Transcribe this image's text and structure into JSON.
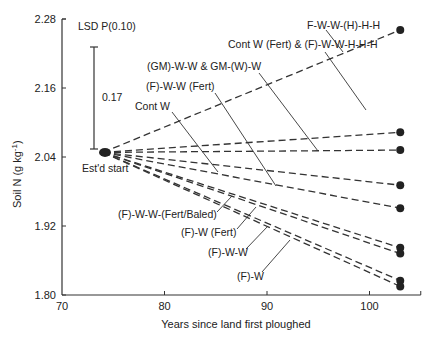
{
  "chart_data": {
    "type": "line",
    "title": "",
    "xlabel": "Years since land first ploughed",
    "ylabel": "Soil N (g kg-1)",
    "ylabel_main": "Soil N (g kg",
    "ylabel_sup": "-1",
    "ylabel_close": ")",
    "xlim": [
      70,
      105
    ],
    "ylim": [
      1.8,
      2.28
    ],
    "x_ticks": [
      70,
      80,
      90,
      100
    ],
    "x_tick_labels": [
      "70",
      "80",
      "90",
      "100"
    ],
    "y_ticks": [
      1.8,
      1.92,
      2.04,
      2.16,
      2.28
    ],
    "y_tick_labels": [
      "1.80",
      "1.92",
      "2.04",
      "2.16",
      "2.28"
    ],
    "grid": false,
    "legend": "none (direct labels with leader lines)",
    "start_point": {
      "x": 74,
      "y": 2.048,
      "label": "Est'd start"
    },
    "end_x": 103,
    "series": [
      {
        "name": "F-W-W-(H)-H-H",
        "x": [
          74,
          103
        ],
        "values": [
          2.048,
          2.261
        ]
      },
      {
        "name": "Cont W (Fert) & (F)-W-W-H-H-H",
        "x": [
          74,
          103
        ],
        "values": [
          2.048,
          2.083
        ]
      },
      {
        "name": "(GM)-W-W & GM-(W)-W",
        "x": [
          74,
          103
        ],
        "values": [
          2.048,
          2.052
        ]
      },
      {
        "name": "(F)-W-W (Fert)",
        "x": [
          74,
          103
        ],
        "values": [
          2.048,
          1.991
        ]
      },
      {
        "name": "Cont W",
        "x": [
          74,
          103
        ],
        "values": [
          2.048,
          1.951
        ]
      },
      {
        "name": "(F)-W-W-(Fert/Baled)",
        "x": [
          74,
          103
        ],
        "values": [
          2.048,
          1.882
        ]
      },
      {
        "name": "(F)-W (Fert)",
        "x": [
          74,
          103
        ],
        "values": [
          2.048,
          1.872
        ]
      },
      {
        "name": "(F)-W-W",
        "x": [
          74,
          103
        ],
        "values": [
          2.048,
          1.825
        ]
      },
      {
        "name": "(F)-W",
        "x": [
          74,
          103
        ],
        "values": [
          2.048,
          1.815
        ]
      }
    ],
    "annotations": {
      "lsd_title": "LSD P(0.10)",
      "lsd_value": "0.17",
      "start_label": "Est'd start"
    }
  }
}
